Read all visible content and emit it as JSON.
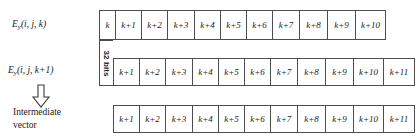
{
  "figure": {
    "labels": {
      "row1_label_base": "E",
      "row1_label_sub": "y",
      "row1_label_args": "(i, j, k)",
      "row2_label_base": "E",
      "row2_label_sub": "y",
      "row2_label_args": "(i, j, k+1)",
      "bits_label": "32 bits",
      "intermediate_line1": "Intermediate",
      "intermediate_line2": "vector"
    },
    "rows": [
      {
        "name": "ey-i-j-k",
        "cells": [
          "k",
          "k+1",
          "k+2",
          "k+3",
          "k+4",
          "k+5",
          "k+6",
          "k+7",
          "k+8",
          "k+9",
          "k+10"
        ],
        "cell_widths": [
          16,
          26,
          26,
          27,
          26,
          26,
          26,
          27,
          28,
          28,
          29
        ]
      },
      {
        "name": "ey-i-j-k-plus-1",
        "cells": [
          "k+1",
          "k+2",
          "k+3",
          "k+4",
          "k+5",
          "k+6",
          "k+7",
          "k+8",
          "k+9",
          "k+10",
          "k+11"
        ],
        "cell_widths": [
          26,
          26,
          27,
          26,
          26,
          26,
          27,
          28,
          28,
          30,
          30
        ]
      },
      {
        "name": "intermediate-vector",
        "cells": [
          "k+1",
          "k+2",
          "k+3",
          "k+4",
          "k+5",
          "k+6",
          "k+7",
          "k+8",
          "k+9",
          "k+10",
          "k+11"
        ],
        "cell_widths": [
          26,
          26,
          27,
          26,
          26,
          26,
          27,
          28,
          28,
          30,
          30
        ]
      }
    ],
    "colors": {
      "border": "#4d4d4d",
      "text": "#1a1a1a",
      "background": "#ffffff"
    },
    "icons": {
      "arrow_down": "arrow-down-outline-icon"
    }
  }
}
